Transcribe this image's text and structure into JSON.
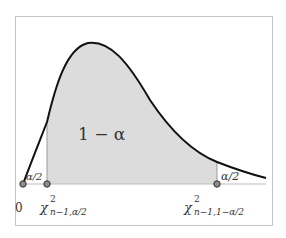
{
  "diagram": {
    "colors": {
      "curve": "#111111",
      "fill": "#dcdcdc",
      "axis": "#bdbdbd",
      "frame": "#c4c4c4",
      "point_fill": "#8a8a8a",
      "point_stroke": "#333333",
      "text": "#333333"
    },
    "labels": {
      "center_region": "1 − α",
      "left_tail": "α/2",
      "right_tail": "α/2",
      "origin": "0",
      "lower_critical": {
        "symbol": "χ",
        "superscript": "2",
        "subscript": "n−1,α/2"
      },
      "upper_critical": {
        "symbol": "χ",
        "superscript": "2",
        "subscript": "n−1,1−α/2"
      }
    },
    "points": [
      {
        "name": "origin",
        "x": 23,
        "y": 184
      },
      {
        "name": "lower-critical",
        "x": 47,
        "y": 184
      },
      {
        "name": "upper-critical",
        "x": 217,
        "y": 184
      }
    ]
  }
}
